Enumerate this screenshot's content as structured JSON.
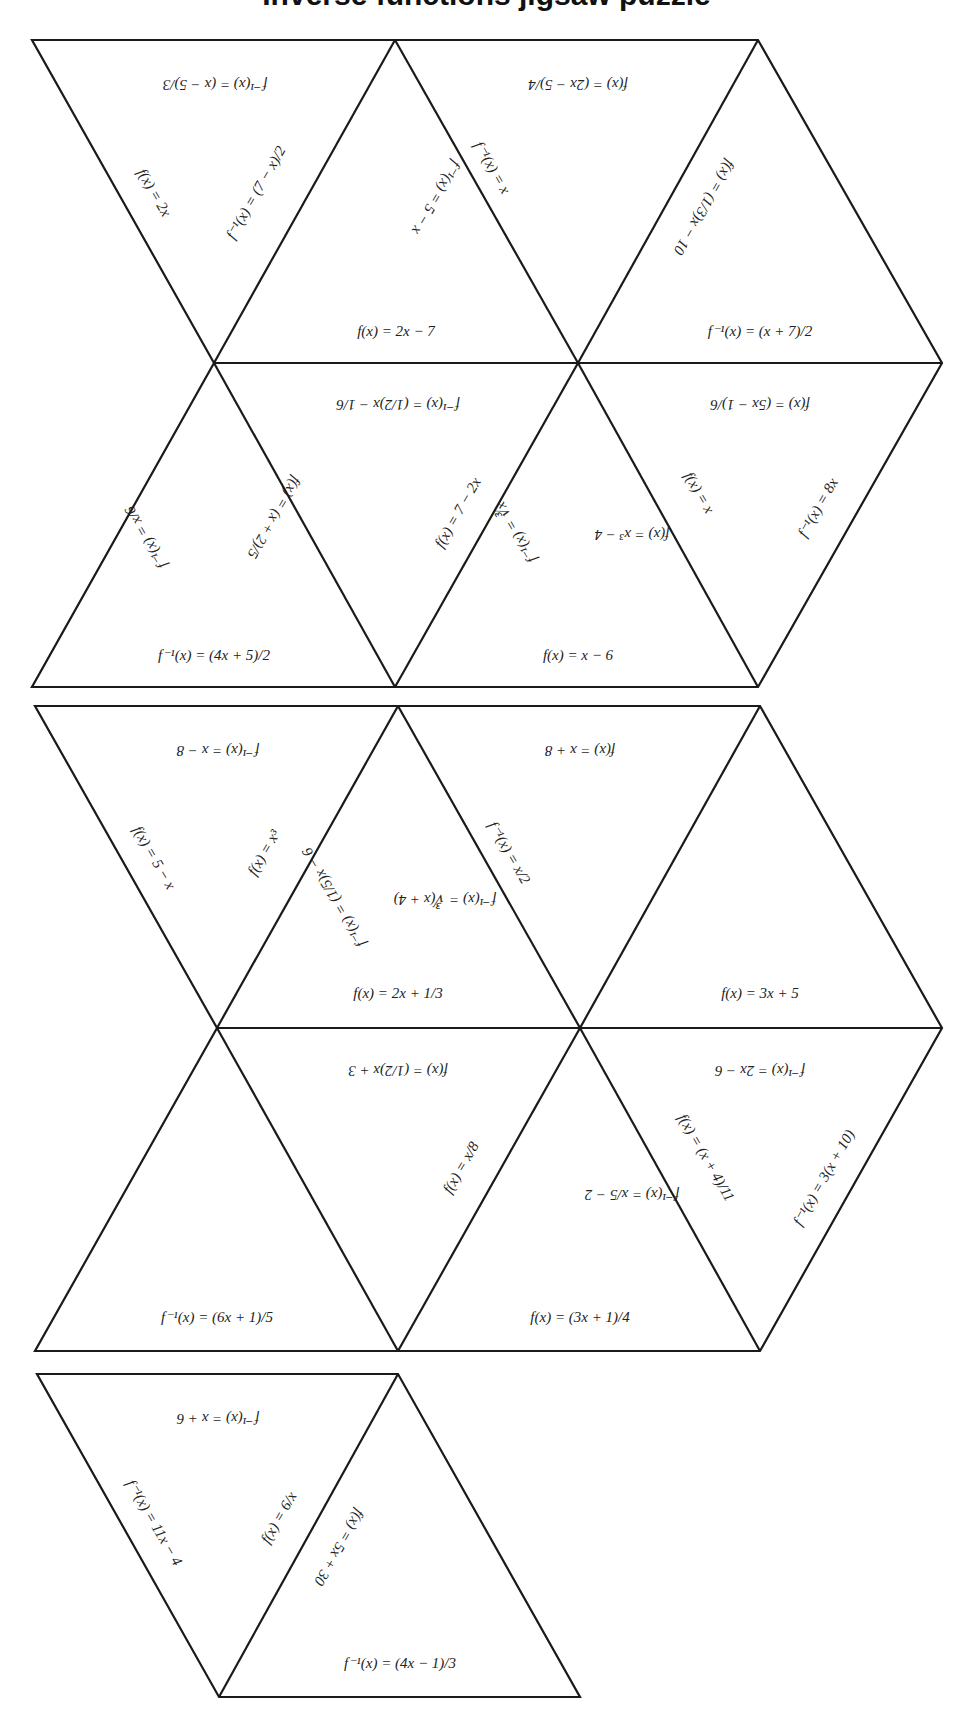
{
  "page": {
    "title_fragment": "Inverse functions jigsaw puzzle",
    "background": "#ffffff",
    "line_color": "#1a1a1a",
    "text_color": "#222222"
  },
  "puzzle": {
    "groups": [
      {
        "name": "group-1",
        "pieces": [
          {
            "id": "g1-t1",
            "orientation": "down",
            "labels": {
              "top": "f⁻¹(x) = (x − 5)/3",
              "left": "f(x) = 2x",
              "right": "f⁻¹(x) = (7 − x)/2"
            }
          },
          {
            "id": "g1-t2",
            "orientation": "up",
            "labels": {
              "left": "f⁻¹(x) = 5 − x",
              "right": "f⁻¹(x) = x",
              "bottom": "f(x) = 2x − 7"
            }
          },
          {
            "id": "g1-t3",
            "orientation": "down",
            "labels": {
              "top": "f(x) = (2x − 5)/4",
              "right": "f(x) = (1/3)x − 10"
            }
          },
          {
            "id": "g1-t4",
            "orientation": "up",
            "labels": {
              "left": "f(x) = (1/3)x − 10",
              "bottom": "f⁻¹(x) = (x + 7)/2"
            }
          },
          {
            "id": "g1-t5",
            "orientation": "up",
            "labels": {
              "left": "f⁻¹(x) = x/6",
              "right": "f(x) = (x + 2)/5",
              "bottom": "f⁻¹(x) = (4x + 5)/2"
            }
          },
          {
            "id": "g1-t6",
            "orientation": "down",
            "labels": {
              "top": "f⁻¹(x) = (1/2)x − 1/6",
              "left": "f(x) = (x + 2)/5",
              "right": "f(x) = 7 − 2x"
            }
          },
          {
            "id": "g1-t7",
            "orientation": "up",
            "labels": {
              "left": "f⁻¹(x) = ∛x",
              "right": "f(x) = x³ − 4",
              "bottom": "f(x) = x − 6"
            }
          },
          {
            "id": "g1-t8",
            "orientation": "down",
            "labels": {
              "top": "f(x) = (5x − 1)/6",
              "left": "f(x) = x",
              "right": "f⁻¹(x) = 8x"
            }
          }
        ]
      },
      {
        "name": "group-2",
        "pieces": [
          {
            "id": "g2-t1",
            "orientation": "down",
            "labels": {
              "top": "f⁻¹(x) = x − 8",
              "left": "f(x) = 5 − x",
              "right": "f(x) = x³"
            }
          },
          {
            "id": "g2-t2",
            "orientation": "up",
            "labels": {
              "left": "f⁻¹(x) = (1/5)x − 6",
              "right": "f⁻¹(x) = ∛(x + 4)",
              "bottom": "f(x) = 2x + 1/3"
            }
          },
          {
            "id": "g2-t3",
            "orientation": "down",
            "labels": {
              "top": "f(x) = x + 8",
              "left": "f⁻¹(x) = x/2"
            }
          },
          {
            "id": "g2-t4",
            "orientation": "up",
            "labels": {
              "bottom": "f(x) = 3x + 5"
            }
          },
          {
            "id": "g2-t5",
            "orientation": "up",
            "labels": {
              "bottom": "f⁻¹(x) = (6x + 1)/5"
            }
          },
          {
            "id": "g2-t6",
            "orientation": "down",
            "labels": {
              "top": "f(x) = (1/2)x + 3",
              "right": "f(x) = x/8"
            }
          },
          {
            "id": "g2-t7",
            "orientation": "up",
            "labels": {
              "right": "f⁻¹(x) = x/5 − 2",
              "bottom": "f(x) = (3x + 1)/4"
            }
          },
          {
            "id": "g2-t8",
            "orientation": "down",
            "labels": {
              "top": "f⁻¹(x) = 2x − 6",
              "left": "f(x) = (x + 4)/11",
              "right": "f⁻¹(x) = 3(x + 10)"
            }
          }
        ]
      },
      {
        "name": "group-3",
        "pieces": [
          {
            "id": "g3-t1",
            "orientation": "down",
            "labels": {
              "top": "f⁻¹(x) = x + 6",
              "left": "f⁻¹(x) = 11x − 4",
              "right": "f(x) = 6/x"
            }
          },
          {
            "id": "g3-t2",
            "orientation": "up",
            "labels": {
              "left": "f(x) = 5x + 30",
              "bottom": "f⁻¹(x) = (4x − 1)/3"
            }
          }
        ]
      }
    ]
  },
  "text": {
    "g1_t1_top": "f⁻¹(x) = (x − 5)/3",
    "g1_t1_left": "f(x) = 2x",
    "g1_t1_right": "f⁻¹(x) = (7 − x)/2",
    "g1_t2_left": "f⁻¹(x) = 5 − x",
    "g1_t2_right": "f⁻¹(x) = x",
    "g1_t2_bottom": "f(x) = 2x − 7",
    "g1_t3_top": "f(x) = (2x − 5)/4",
    "g1_t4_left": "f(x) = (1/3)x − 10",
    "g1_t4_bottom": "f⁻¹(x) = (x + 7)/2",
    "g1_t5_left": "f⁻¹(x) = x/6",
    "g1_t5_right": "f(x) = (x + 2)/5",
    "g1_t5_bottom": "f⁻¹(x) = (4x + 5)/2",
    "g1_t6_top": "f⁻¹(x) = (1/2)x − 1/6",
    "g1_t6_right": "f(x) = 7 − 2x",
    "g1_t7_left": "f⁻¹(x) = ∛x",
    "g1_t7_right": "f(x) = x³ − 4",
    "g1_t7_bottom": "f(x) = x − 6",
    "g1_t8_top": "f(x) = (5x − 1)/6",
    "g1_t8_left": "f(x) = x",
    "g1_t8_right": "f⁻¹(x) = 8x",
    "g2_t1_top": "f⁻¹(x) = x − 8",
    "g2_t1_left": "f(x) = 5 − x",
    "g2_t1_right": "f(x) = x³",
    "g2_t2_left": "f⁻¹(x) = (1/5)x − 6",
    "g2_t2_right": "f⁻¹(x) = ∛(x + 4)",
    "g2_t2_bottom": "f(x) = 2x + 1/3",
    "g2_t3_top": "f(x) = x + 8",
    "g2_t3_left": "f⁻¹(x) = x/2",
    "g2_t4_bottom": "f(x) = 3x + 5",
    "g2_t5_bottom": "f⁻¹(x) = (6x + 1)/5",
    "g2_t6_top": "f(x) = (1/2)x + 3",
    "g2_t6_right": "f(x) = x/8",
    "g2_t7_right": "f⁻¹(x) = x/5 − 2",
    "g2_t7_bottom": "f(x) = (3x + 1)/4",
    "g2_t8_top": "f⁻¹(x) = 2x − 6",
    "g2_t8_left": "f(x) = (x + 4)/11",
    "g2_t8_right": "f⁻¹(x) = 3(x + 10)",
    "g3_t1_top": "f⁻¹(x) = x + 6",
    "g3_t1_left": "f⁻¹(x) = 11x − 4",
    "g3_t1_right": "f(x) = 6/x",
    "g3_t2_left": "f(x) = 5x + 30",
    "g3_t2_bottom": "f⁻¹(x) = (4x − 1)/3"
  }
}
